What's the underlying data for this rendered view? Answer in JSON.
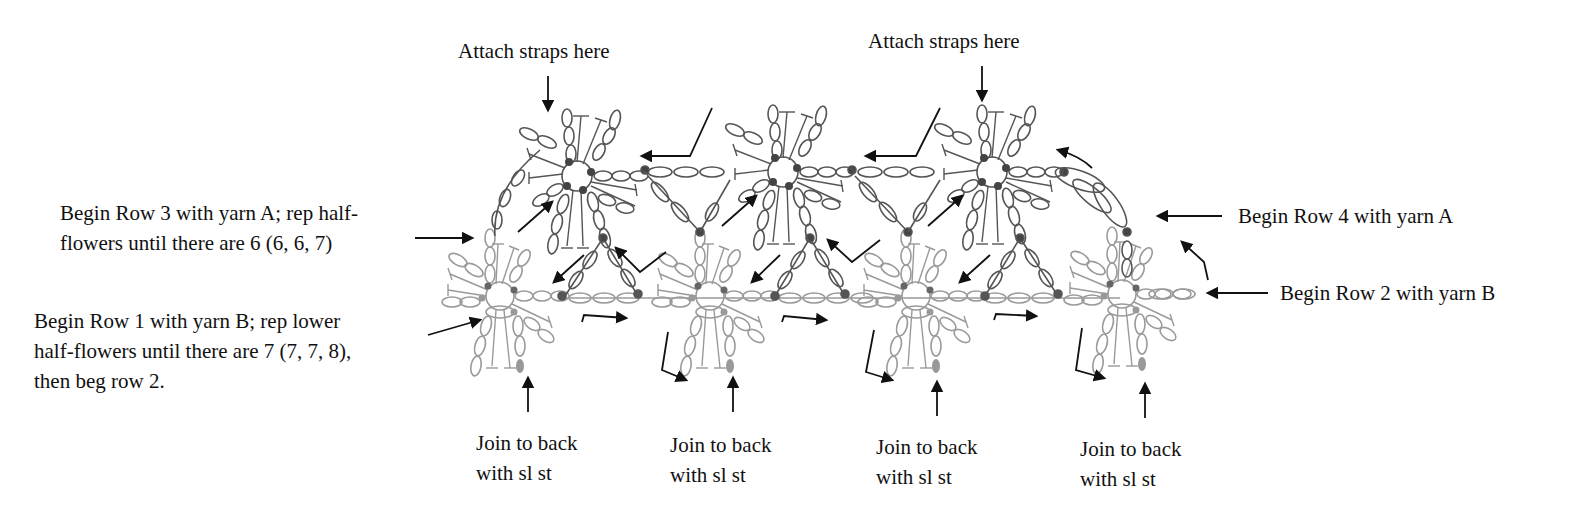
{
  "diagram": {
    "type": "crochet-stitch-chart",
    "colors": {
      "yarn_A_rows": "#555555",
      "yarn_B_rows": "#9a9a9a",
      "arrows": "#111111",
      "background": "#ffffff"
    },
    "flower_count_upper": 3,
    "flower_count_lower": 4
  },
  "labels": {
    "attach_straps_left": "Attach straps here",
    "attach_straps_right": "Attach straps here",
    "row3": {
      "line1": "Begin Row 3 with yarn A; rep half-",
      "line2": "flowers until there are 6 (6, 6, 7)"
    },
    "row1": {
      "line1": "Begin Row 1 with yarn B; rep lower",
      "line2": "half-flowers until there are 7 (7, 7, 8),",
      "line3": "then beg row 2."
    },
    "row4": "Begin Row 4 with yarn A",
    "row2": "Begin Row 2 with yarn B",
    "join": [
      {
        "line1": "Join to back",
        "line2": "with sl st"
      },
      {
        "line1": "Join to back",
        "line2": "with sl st"
      },
      {
        "line1": "Join to back",
        "line2": "with sl st"
      },
      {
        "line1": "Join to back",
        "line2": "with sl st"
      }
    ]
  }
}
